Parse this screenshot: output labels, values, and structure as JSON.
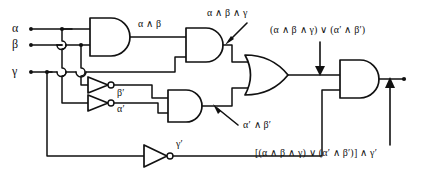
{
  "diagram": {
    "kind": "logic-circuit-schematic",
    "ink_color": "#111111",
    "background_color": "#ffffff",
    "inputs": [
      {
        "name": "alpha",
        "label": "α"
      },
      {
        "name": "beta",
        "label": "β"
      },
      {
        "name": "gamma",
        "label": "γ"
      }
    ],
    "signal_labels": {
      "and_ab": "α ∧ β",
      "not_beta": "β′",
      "not_alpha": "α′",
      "not_gamma": "γ′"
    },
    "annotations": {
      "and_abg": "α ∧ β ∧ γ",
      "and_not_a_not_b": "α′ ∧ β′",
      "or_output": "(α ∧ β ∧ γ) ∨ (α′ ∧ β′)",
      "final_output": "[(α ∧ β ∧ γ) ∨ (α′ ∧ β′)] ∧ γ′"
    },
    "gates": [
      {
        "name": "and-gate-ab",
        "type": "AND",
        "inputs": 2,
        "output": "α ∧ β"
      },
      {
        "name": "and-gate-abg",
        "type": "AND",
        "inputs": 2,
        "output": "α ∧ β ∧ γ"
      },
      {
        "name": "not-gate-beta",
        "type": "NOT",
        "inputs": 1,
        "output": "β′"
      },
      {
        "name": "not-gate-alpha",
        "type": "NOT",
        "inputs": 1,
        "output": "α′"
      },
      {
        "name": "and-gate-not-a-not-b",
        "type": "AND",
        "inputs": 2,
        "output": "α′ ∧ β′"
      },
      {
        "name": "or-gate",
        "type": "OR",
        "inputs": 2,
        "output": "(α ∧ β ∧ γ) ∨ (α′ ∧ β′)"
      },
      {
        "name": "not-gate-gamma",
        "type": "NOT",
        "inputs": 1,
        "output": "γ′"
      },
      {
        "name": "and-gate-final",
        "type": "AND",
        "inputs": 2,
        "output": "[(α ∧ β ∧ γ) ∨ (α′ ∧ β′)] ∧ γ′"
      }
    ]
  }
}
